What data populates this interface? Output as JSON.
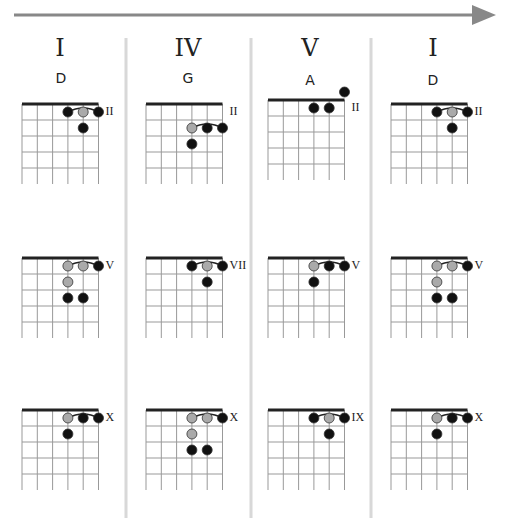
{
  "progression": {
    "direction_arrow": "right-arrow-icon",
    "columns": [
      {
        "numeral": "I",
        "chord": "D",
        "voicings": [
          {
            "fret_label": "II",
            "top_row": 1,
            "dots": [
              {
                "s": 3,
                "r": 1,
                "c": "black"
              },
              {
                "s": 4,
                "r": 1,
                "c": "gray"
              },
              {
                "s": 5,
                "r": 1,
                "c": "black"
              },
              {
                "s": 4,
                "r": 2,
                "c": "black"
              }
            ],
            "barre": [
              3,
              5
            ]
          },
          {
            "fret_label": "V",
            "top_row": 1,
            "dots": [
              {
                "s": 3,
                "r": 1,
                "c": "gray"
              },
              {
                "s": 4,
                "r": 1,
                "c": "gray"
              },
              {
                "s": 5,
                "r": 1,
                "c": "black"
              },
              {
                "s": 3,
                "r": 2,
                "c": "gray"
              },
              {
                "s": 3,
                "r": 3,
                "c": "black"
              },
              {
                "s": 4,
                "r": 3,
                "c": "black"
              }
            ],
            "barre": [
              3,
              5
            ]
          },
          {
            "fret_label": "X",
            "top_row": 1,
            "dots": [
              {
                "s": 3,
                "r": 1,
                "c": "gray"
              },
              {
                "s": 4,
                "r": 1,
                "c": "black"
              },
              {
                "s": 5,
                "r": 1,
                "c": "black"
              },
              {
                "s": 3,
                "r": 2,
                "c": "black"
              }
            ],
            "barre": [
              3,
              5
            ]
          }
        ]
      },
      {
        "numeral": "IV",
        "chord": "G",
        "voicings": [
          {
            "fret_label": "II",
            "top_row": 1,
            "dots": [
              {
                "s": 3,
                "r": 2,
                "c": "gray"
              },
              {
                "s": 4,
                "r": 2,
                "c": "black"
              },
              {
                "s": 5,
                "r": 2,
                "c": "black"
              },
              {
                "s": 3,
                "r": 3,
                "c": "black"
              }
            ],
            "barre": [
              3,
              5
            ],
            "barre_row": 2
          },
          {
            "fret_label": "VII",
            "top_row": 1,
            "dots": [
              {
                "s": 3,
                "r": 1,
                "c": "black"
              },
              {
                "s": 4,
                "r": 1,
                "c": "gray"
              },
              {
                "s": 5,
                "r": 1,
                "c": "black"
              },
              {
                "s": 4,
                "r": 2,
                "c": "black"
              }
            ],
            "barre": [
              3,
              5
            ]
          },
          {
            "fret_label": "X",
            "top_row": 1,
            "dots": [
              {
                "s": 3,
                "r": 1,
                "c": "gray"
              },
              {
                "s": 4,
                "r": 1,
                "c": "gray"
              },
              {
                "s": 5,
                "r": 1,
                "c": "black"
              },
              {
                "s": 3,
                "r": 2,
                "c": "gray"
              },
              {
                "s": 3,
                "r": 3,
                "c": "black"
              },
              {
                "s": 4,
                "r": 3,
                "c": "black"
              }
            ],
            "barre": [
              3,
              5
            ]
          }
        ]
      },
      {
        "numeral": "V",
        "chord": "A",
        "voicings": [
          {
            "fret_label": "II",
            "top_row": 1,
            "dots": [
              {
                "s": 5,
                "r": 0,
                "c": "black"
              },
              {
                "s": 3,
                "r": 1,
                "c": "black"
              },
              {
                "s": 4,
                "r": 1,
                "c": "black"
              }
            ],
            "barre": null
          },
          {
            "fret_label": "V",
            "top_row": 1,
            "dots": [
              {
                "s": 3,
                "r": 1,
                "c": "gray"
              },
              {
                "s": 4,
                "r": 1,
                "c": "black"
              },
              {
                "s": 5,
                "r": 1,
                "c": "black"
              },
              {
                "s": 3,
                "r": 2,
                "c": "black"
              }
            ],
            "barre": [
              3,
              5
            ]
          },
          {
            "fret_label": "IX",
            "top_row": 1,
            "dots": [
              {
                "s": 3,
                "r": 1,
                "c": "black"
              },
              {
                "s": 4,
                "r": 1,
                "c": "gray"
              },
              {
                "s": 5,
                "r": 1,
                "c": "black"
              },
              {
                "s": 4,
                "r": 2,
                "c": "black"
              }
            ],
            "barre": [
              3,
              5
            ]
          }
        ]
      },
      {
        "numeral": "I",
        "chord": "D",
        "voicings": [
          {
            "fret_label": "II",
            "top_row": 1,
            "dots": [
              {
                "s": 3,
                "r": 1,
                "c": "black"
              },
              {
                "s": 4,
                "r": 1,
                "c": "gray"
              },
              {
                "s": 5,
                "r": 1,
                "c": "black"
              },
              {
                "s": 4,
                "r": 2,
                "c": "black"
              }
            ],
            "barre": [
              3,
              5
            ]
          },
          {
            "fret_label": "V",
            "top_row": 1,
            "dots": [
              {
                "s": 3,
                "r": 1,
                "c": "gray"
              },
              {
                "s": 4,
                "r": 1,
                "c": "gray"
              },
              {
                "s": 5,
                "r": 1,
                "c": "black"
              },
              {
                "s": 3,
                "r": 2,
                "c": "gray"
              },
              {
                "s": 3,
                "r": 3,
                "c": "black"
              },
              {
                "s": 4,
                "r": 3,
                "c": "black"
              }
            ],
            "barre": [
              3,
              5
            ]
          },
          {
            "fret_label": "X",
            "top_row": 1,
            "dots": [
              {
                "s": 3,
                "r": 1,
                "c": "gray"
              },
              {
                "s": 4,
                "r": 1,
                "c": "black"
              },
              {
                "s": 5,
                "r": 1,
                "c": "black"
              },
              {
                "s": 3,
                "r": 2,
                "c": "black"
              }
            ],
            "barre": [
              3,
              5
            ]
          }
        ]
      }
    ]
  },
  "colors": {
    "arrow": "#888888",
    "divider": "#d8d8d8",
    "grid": "#999999",
    "nut": "#222222",
    "dot_black": "#111111",
    "dot_gray": "#aaaaaa"
  }
}
